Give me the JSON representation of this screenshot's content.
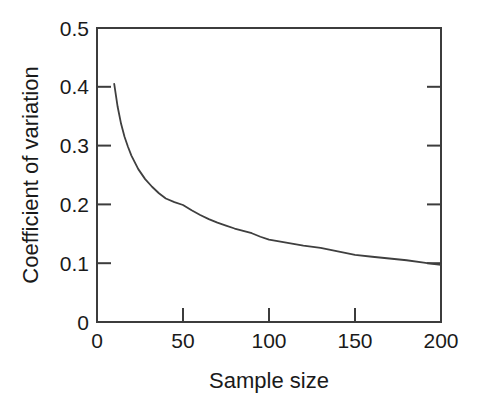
{
  "chart_data": {
    "type": "line",
    "title": "",
    "subtitle": "",
    "xlabel": "Sample size",
    "ylabel": "Coefficient of variation",
    "xlim": [
      0,
      200
    ],
    "ylim": [
      0,
      0.5
    ],
    "xticks": [
      0,
      50,
      100,
      150,
      200
    ],
    "xtick_labels": [
      "0",
      "50",
      "100",
      "150",
      "200"
    ],
    "yticks": [
      0,
      0.1,
      0.2,
      0.3,
      0.4,
      0.5
    ],
    "ytick_labels": [
      "0",
      "0.1",
      "0.2",
      "0.3",
      "0.4",
      "0.5"
    ],
    "grid": false,
    "legend": false,
    "legend_position": "none",
    "line_color": "#3f3f3f",
    "axis_color": "#3c3c3c",
    "background_color": "#ffffff",
    "series": [
      {
        "name": "Coefficient of variation",
        "x": [
          10,
          12,
          14,
          16,
          18,
          20,
          24,
          28,
          32,
          36,
          40,
          45,
          50,
          55,
          60,
          65,
          70,
          75,
          80,
          85,
          90,
          95,
          100,
          110,
          120,
          130,
          140,
          150,
          160,
          170,
          180,
          190,
          195,
          200
        ],
        "values": [
          0.405,
          0.366,
          0.337,
          0.315,
          0.298,
          0.283,
          0.26,
          0.243,
          0.23,
          0.219,
          0.21,
          0.204,
          0.199,
          0.19,
          0.182,
          0.175,
          0.169,
          0.164,
          0.159,
          0.155,
          0.151,
          0.145,
          0.14,
          0.135,
          0.13,
          0.126,
          0.12,
          0.114,
          0.111,
          0.108,
          0.105,
          0.101,
          0.099,
          0.097
        ]
      }
    ]
  },
  "axes": {
    "y_axis_title": "Coefficient of variation",
    "x_axis_title": "Sample size",
    "y_labels": {
      "t0": "0",
      "t1": "0.1",
      "t2": "0.2",
      "t3": "0.3",
      "t4": "0.4",
      "t5": "0.5"
    },
    "x_labels": {
      "t0": "0",
      "t1": "50",
      "t2": "100",
      "t3": "150",
      "t4": "200"
    }
  }
}
